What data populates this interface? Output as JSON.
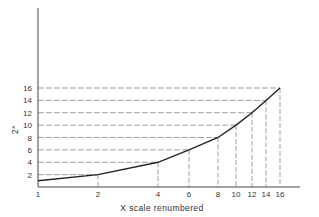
{
  "chart_data": {
    "type": "line",
    "title": "",
    "xlabel": "X scale renumbered",
    "ylabel": "2^x",
    "ylabel_display": {
      "base": "2",
      "exp": "x"
    },
    "x_ticks": [
      {
        "label": "1",
        "px": 38
      },
      {
        "label": "2",
        "px": 98
      },
      {
        "label": "4",
        "px": 158
      },
      {
        "label": "6",
        "px": 189
      },
      {
        "label": "8",
        "px": 218
      },
      {
        "label": "10",
        "px": 236
      },
      {
        "label": "12",
        "px": 252
      },
      {
        "label": "14",
        "px": 266
      },
      {
        "label": "16",
        "px": 280
      }
    ],
    "y_ticks": [
      {
        "label": "2",
        "value": 2
      },
      {
        "label": "4",
        "value": 4
      },
      {
        "label": "6",
        "value": 6
      },
      {
        "label": "8",
        "value": 8
      },
      {
        "label": "10",
        "value": 10
      },
      {
        "label": "12",
        "value": 12
      },
      {
        "label": "14",
        "value": 14
      },
      {
        "label": "16",
        "value": 16
      }
    ],
    "series": [
      {
        "name": "2^x",
        "x": [
          1,
          2,
          4,
          6,
          8,
          10,
          12,
          14,
          16
        ],
        "y": [
          1,
          2,
          4,
          6,
          8,
          10,
          12,
          14,
          16
        ]
      }
    ],
    "ylim": [
      0,
      16
    ],
    "grid": "dashed guide lines from each curve point to both axes",
    "legend": null
  }
}
